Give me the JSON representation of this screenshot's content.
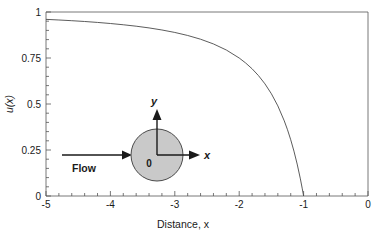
{
  "chart_data": {
    "type": "line",
    "title": "",
    "xlabel": "Distance, x",
    "ylabel": "u(x)",
    "xlim": [
      -5,
      0
    ],
    "ylim": [
      0,
      1
    ],
    "grid": false,
    "legend": "none",
    "xticks": [
      "-5",
      "-4",
      "-3",
      "-2",
      "-1",
      "0"
    ],
    "xtick_values": [
      -5,
      -4,
      -3,
      -2,
      -1,
      0
    ],
    "yticks": [
      "0",
      "0.25",
      "0.5",
      "0.75",
      "1"
    ],
    "ytick_values": [
      0,
      0.25,
      0.5,
      0.75,
      1
    ],
    "x_minor_per_interval": 5,
    "y_minor_per_interval": 5,
    "series": [
      {
        "name": "u(x)",
        "formula": "u(x) = 1 - 1/x^2",
        "x": [
          -5.0,
          -4.8,
          -4.6,
          -4.4,
          -4.2,
          -4.0,
          -3.8,
          -3.6,
          -3.4,
          -3.2,
          -3.0,
          -2.8,
          -2.6,
          -2.4,
          -2.2,
          -2.0,
          -1.9,
          -1.8,
          -1.7,
          -1.6,
          -1.5,
          -1.4,
          -1.3,
          -1.25,
          -1.2,
          -1.15,
          -1.1,
          -1.05,
          -1.02,
          -1.0
        ],
        "values": [
          0.96,
          0.9566,
          0.9527,
          0.9484,
          0.9433,
          0.9375,
          0.9307,
          0.9228,
          0.9135,
          0.9023,
          0.8889,
          0.8724,
          0.8521,
          0.8264,
          0.7934,
          0.75,
          0.723,
          0.6914,
          0.654,
          0.6094,
          0.5556,
          0.4898,
          0.4083,
          0.36,
          0.3056,
          0.2439,
          0.1736,
          0.093,
          0.0388,
          0.0
        ]
      }
    ],
    "annotations": {
      "inset": {
        "type": "cylinder-schematic",
        "origin_label": "0",
        "x_axis_label": "x",
        "y_axis_label": "y",
        "flow_label": "Flow",
        "circle_fill": "#c9c9c9",
        "circle_stroke": "#4a4a4a"
      }
    },
    "colors": {
      "curve": "#4a4a4a",
      "frame": "#555555",
      "text": "#1a1a1a",
      "background": "#ffffff"
    }
  }
}
